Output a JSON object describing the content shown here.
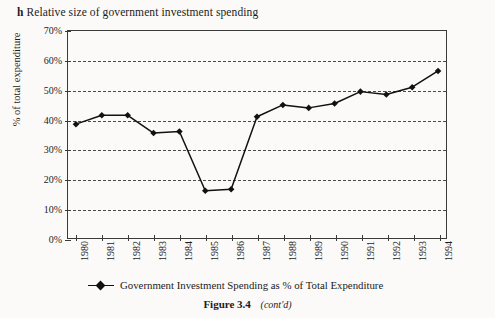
{
  "heading": {
    "letter": "h",
    "text": "Relative size of government investment spending"
  },
  "caption": {
    "figure": "Figure 3.4",
    "note": "(cont'd)"
  },
  "legend": {
    "label": "Government Investment Spending as % of Total Expenditure",
    "marker": "diamond-marker",
    "position": "below-axis-center"
  },
  "colors": {
    "line": "#111111",
    "marker": "#111111",
    "axis": "#3a3a3a",
    "grid": "#4a4a4a",
    "background": "#fbfaf8"
  },
  "chart_data": {
    "type": "line",
    "title": "Relative size of government investment spending",
    "xlabel": "",
    "ylabel": "% of total expenditure",
    "categories": [
      "1980",
      "1981",
      "1982",
      "1983",
      "1984",
      "1985",
      "1986",
      "1987",
      "1988",
      "1989",
      "1990",
      "1991",
      "1992",
      "1993",
      "1994"
    ],
    "x": [
      1980,
      1981,
      1982,
      1983,
      1984,
      1985,
      1986,
      1987,
      1988,
      1989,
      1990,
      1991,
      1992,
      1993,
      1994
    ],
    "series": [
      {
        "name": "Government Investment Spending as % of Total Expenditure",
        "values": [
          38.5,
          41.5,
          41.5,
          35.5,
          36.0,
          16.0,
          16.5,
          41.0,
          45.0,
          44.0,
          45.5,
          49.5,
          48.5,
          51.0,
          56.5
        ]
      }
    ],
    "ylim": [
      0,
      70
    ],
    "yticks": [
      0,
      10,
      20,
      30,
      40,
      50,
      60,
      70
    ],
    "ytick_labels": [
      "0%",
      "10%",
      "20%",
      "30%",
      "40%",
      "50%",
      "60%",
      "70%"
    ],
    "grid": "horizontal-dashed",
    "legend_position": "bottom"
  }
}
